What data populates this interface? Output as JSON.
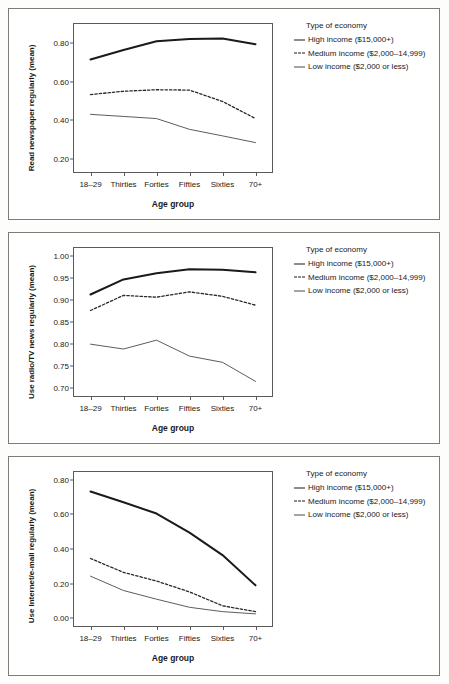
{
  "figure": {
    "panel_count": 3,
    "legend_title": "Type of economy",
    "series_names": [
      "High income ($15,000+)",
      "Medium income ($2,000–14,999)",
      "Low income ($2,000 or less)"
    ],
    "xlabel": "Age group",
    "categories": [
      "18–29",
      "Thirties",
      "Forties",
      "Fifties",
      "Sixties",
      "70+"
    ]
  },
  "chart_data": [
    {
      "type": "line",
      "title": "",
      "xlabel": "Age group",
      "ylabel": "Read newspaper regularly (mean)",
      "categories": [
        "18–29",
        "Thirties",
        "Forties",
        "Fifties",
        "Sixties",
        "70+"
      ],
      "ylim": [
        0.13,
        0.9
      ],
      "yticks": [
        0.2,
        0.4,
        0.6,
        0.8
      ],
      "ytick_labels": [
        "0.20",
        "0.40",
        "0.60",
        "0.80"
      ],
      "grid": false,
      "legend_position": "right",
      "legend_title": "Type of economy",
      "series": [
        {
          "name": "High income ($15,000+)",
          "style": "solid-thick",
          "values": [
            0.715,
            0.765,
            0.81,
            0.822,
            0.824,
            0.795
          ]
        },
        {
          "name": "Medium income ($2,000–14,999)",
          "style": "dashed",
          "values": [
            0.533,
            0.55,
            0.558,
            0.556,
            0.497,
            0.408
          ]
        },
        {
          "name": "Low income ($2,000 or less)",
          "style": "solid-thin",
          "values": [
            0.43,
            0.419,
            0.408,
            0.352,
            0.318,
            0.283
          ]
        }
      ]
    },
    {
      "type": "line",
      "title": "",
      "xlabel": "Age group",
      "ylabel": "Use radio/TV news regularly (mean)",
      "categories": [
        "18–29",
        "Thirties",
        "Forties",
        "Fifties",
        "Sixties",
        "70+"
      ],
      "ylim": [
        0.683,
        1.017
      ],
      "yticks": [
        0.7,
        0.75,
        0.8,
        0.85,
        0.9,
        0.95,
        1.0
      ],
      "ytick_labels": [
        "0.70",
        "0.75",
        "0.80",
        "0.85",
        "0.90",
        "0.95",
        "1.00"
      ],
      "grid": false,
      "legend_position": "right",
      "legend_title": "Type of economy",
      "series": [
        {
          "name": "High income ($15,000+)",
          "style": "solid-thick",
          "values": [
            0.912,
            0.946,
            0.96,
            0.969,
            0.968,
            0.962
          ]
        },
        {
          "name": "Medium income ($2,000–14,999)",
          "style": "dashed",
          "values": [
            0.876,
            0.91,
            0.906,
            0.918,
            0.908,
            0.888
          ]
        },
        {
          "name": "Low income ($2,000 or less)",
          "style": "solid-thin",
          "values": [
            0.8,
            0.789,
            0.809,
            0.773,
            0.759,
            0.716
          ]
        }
      ]
    },
    {
      "type": "line",
      "title": "",
      "xlabel": "Age group",
      "ylabel": "Use Internet/e-mail regularly (mean)",
      "categories": [
        "18–29",
        "Thirties",
        "Forties",
        "Fifties",
        "Sixties",
        "70+"
      ],
      "ylim": [
        -0.045,
        0.845
      ],
      "yticks": [
        0.0,
        0.2,
        0.4,
        0.6,
        0.8
      ],
      "ytick_labels": [
        "0.00",
        "0.20",
        "0.40",
        "0.60",
        "0.80"
      ],
      "grid": false,
      "legend_position": "right",
      "legend_title": "Type of economy",
      "series": [
        {
          "name": "High income ($15,000+)",
          "style": "solid-thick",
          "values": [
            0.732,
            0.67,
            0.605,
            0.495,
            0.365,
            0.19
          ]
        },
        {
          "name": "Medium income ($2,000–14,999)",
          "style": "dashed",
          "values": [
            0.345,
            0.265,
            0.215,
            0.152,
            0.072,
            0.038
          ]
        },
        {
          "name": "Low income ($2,000 or less)",
          "style": "solid-thin",
          "values": [
            0.243,
            0.16,
            0.11,
            0.063,
            0.038,
            0.025
          ]
        }
      ]
    }
  ]
}
